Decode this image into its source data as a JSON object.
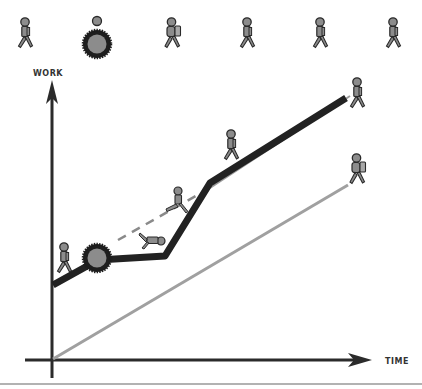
{
  "diagram": {
    "axes": {
      "y_label": "WORK",
      "x_label": "TIME"
    },
    "top_row_icons": [
      {
        "name": "walker-icon",
        "x": 20
      },
      {
        "name": "gear-obstacle-icon",
        "x": 97
      },
      {
        "name": "backpacker-icon",
        "x": 173
      },
      {
        "name": "walker-icon",
        "x": 247
      },
      {
        "name": "walker-icon",
        "x": 320
      },
      {
        "name": "walker-icon",
        "x": 394
      }
    ],
    "lines": {
      "actual_progress": {
        "style": "thick-black",
        "color": "#222222"
      },
      "expected_progress": {
        "style": "dashed-gray",
        "color": "#888888"
      },
      "baseline": {
        "style": "thin-gray",
        "color": "#a0a0a0"
      }
    },
    "colors": {
      "figure_fill": "#8c8c8c",
      "figure_stroke": "#2a2a2a",
      "axis": "#2b2b2b",
      "background": "#ffffff"
    }
  }
}
